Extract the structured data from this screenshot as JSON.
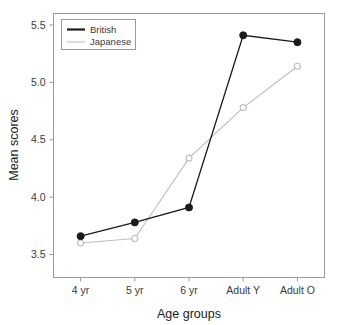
{
  "chart_data": {
    "type": "line",
    "title": "",
    "xlabel": "Age groups",
    "ylabel": "Mean scores",
    "categories": [
      "4 yr",
      "5 yr",
      "6 yr",
      "Adult Y",
      "Adult O"
    ],
    "series": [
      {
        "name": "British",
        "values": [
          3.66,
          3.78,
          3.91,
          5.41,
          5.35
        ],
        "color": "#1a1a1a",
        "marker": "filled-circle"
      },
      {
        "name": "Japanese",
        "values": [
          3.6,
          3.64,
          4.34,
          4.78,
          5.14
        ],
        "color": "#bdbdbd",
        "marker": "open-circle"
      }
    ],
    "ylim": [
      3.3,
      5.6
    ],
    "yticks": [
      3.5,
      4.0,
      4.5,
      5.0,
      5.5
    ],
    "ytick_labels": [
      "3.5",
      "4.0",
      "4.5",
      "5.0",
      "5.5"
    ],
    "xlim": [
      0.5,
      5.5
    ],
    "grid": false,
    "legend_position": "top-left",
    "legend_entries": [
      "British",
      "Japanese"
    ],
    "frame": true
  },
  "axes": {
    "y_title": "Mean scores",
    "x_title": "Age groups"
  },
  "legend": {
    "items": [
      {
        "label": "British",
        "color": "#1a1a1a"
      },
      {
        "label": "Japanese",
        "color": "#bdbdbd"
      }
    ]
  },
  "colors": {
    "british": "#1a1a1a",
    "japanese": "#bdbdbd",
    "frame": "#9a9a9a",
    "background": "#ffffff",
    "text": "#3a3a3a"
  }
}
